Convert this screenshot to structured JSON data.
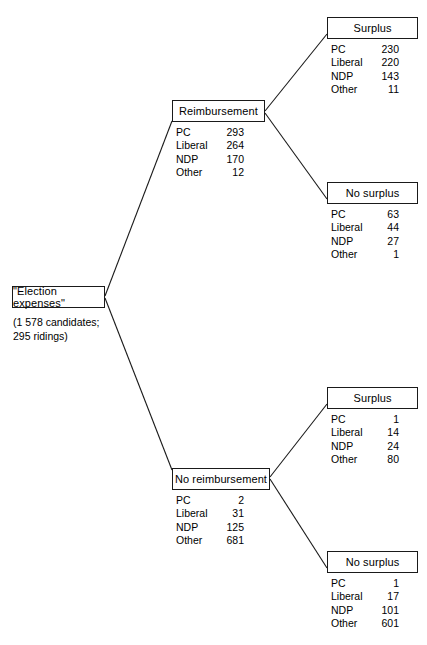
{
  "diagram": {
    "type": "tree",
    "title": "\"Election expenses\"",
    "root": {
      "label": "\"Election expenses\"",
      "caption": "(1 578 candidates;\n295 ridings)"
    },
    "parties": [
      "PC",
      "Liberal",
      "NDP",
      "Other"
    ],
    "nodes": [
      {
        "id": "reimbursement",
        "label": "Reimbursement",
        "rows": [
          {
            "party": "PC",
            "count": "293"
          },
          {
            "party": "Liberal",
            "count": "264"
          },
          {
            "party": "NDP",
            "count": "170"
          },
          {
            "party": "Other",
            "count": "12"
          }
        ]
      },
      {
        "id": "no-reimbursement",
        "label": "No reimbursement",
        "rows": [
          {
            "party": "PC",
            "count": "2"
          },
          {
            "party": "Liberal",
            "count": "31"
          },
          {
            "party": "NDP",
            "count": "125"
          },
          {
            "party": "Other",
            "count": "681"
          }
        ]
      },
      {
        "id": "surplus-upper",
        "label": "Surplus",
        "rows": [
          {
            "party": "PC",
            "count": "230"
          },
          {
            "party": "Liberal",
            "count": "220"
          },
          {
            "party": "NDP",
            "count": "143"
          },
          {
            "party": "Other",
            "count": "11"
          }
        ]
      },
      {
        "id": "no-surplus-upper",
        "label": "No surplus",
        "rows": [
          {
            "party": "PC",
            "count": "63"
          },
          {
            "party": "Liberal",
            "count": "44"
          },
          {
            "party": "NDP",
            "count": "27"
          },
          {
            "party": "Other",
            "count": "1"
          }
        ]
      },
      {
        "id": "surplus-lower",
        "label": "Surplus",
        "rows": [
          {
            "party": "PC",
            "count": "1"
          },
          {
            "party": "Liberal",
            "count": "14"
          },
          {
            "party": "NDP",
            "count": "24"
          },
          {
            "party": "Other",
            "count": "80"
          }
        ]
      },
      {
        "id": "no-surplus-lower",
        "label": "No surplus",
        "rows": [
          {
            "party": "PC",
            "count": "1"
          },
          {
            "party": "Liberal",
            "count": "17"
          },
          {
            "party": "NDP",
            "count": "101"
          },
          {
            "party": "Other",
            "count": "601"
          }
        ]
      }
    ],
    "colors": {
      "line": "#1a1a1a",
      "box_border": "#1a1a1a",
      "text": "#000000",
      "background": "#ffffff"
    }
  }
}
